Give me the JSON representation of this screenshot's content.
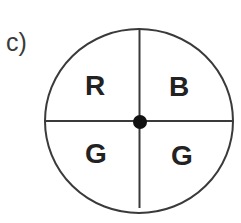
{
  "figure": {
    "label": "c)",
    "spinner": {
      "sectors": [
        {
          "position": "top-left",
          "letter": "R"
        },
        {
          "position": "top-right",
          "letter": "B"
        },
        {
          "position": "bottom-left",
          "letter": "G"
        },
        {
          "position": "bottom-right",
          "letter": "G"
        }
      ],
      "colors": {
        "outline": "#3a3a3a",
        "center_dot": "#111111",
        "text": "#222222"
      }
    }
  }
}
